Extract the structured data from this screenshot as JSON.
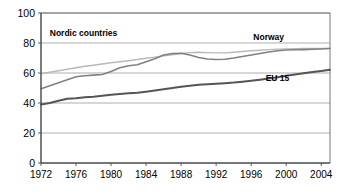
{
  "chart_data": {
    "type": "line",
    "title": "",
    "subtitle": "",
    "xlabel": "",
    "ylabel": "",
    "xlim": [
      1972,
      2005
    ],
    "ylim": [
      0,
      100
    ],
    "yticks": [
      0,
      20,
      40,
      60,
      80,
      100
    ],
    "xticks": [
      1972,
      1976,
      1980,
      1984,
      1988,
      1992,
      1996,
      2000,
      2004
    ],
    "grid": true,
    "legend_position": "inline-annotations",
    "x": [
      1972,
      1973,
      1974,
      1975,
      1976,
      1977,
      1978,
      1979,
      1980,
      1981,
      1982,
      1983,
      1984,
      1985,
      1986,
      1987,
      1988,
      1989,
      1990,
      1991,
      1992,
      1993,
      1994,
      1995,
      1996,
      1997,
      1998,
      1999,
      2000,
      2001,
      2002,
      2003,
      2004,
      2005
    ],
    "series": [
      {
        "name": "Nordic countries",
        "color": "#b9b9b9",
        "label_x": 1973,
        "label_y": 85,
        "values": [
          59.5,
          60.5,
          61.5,
          62.5,
          63.5,
          64.5,
          65.2,
          66.0,
          66.8,
          67.5,
          68.2,
          69.0,
          69.8,
          70.6,
          71.4,
          72.2,
          73.0,
          73.6,
          73.8,
          73.6,
          73.4,
          73.4,
          73.8,
          74.3,
          74.8,
          75.2,
          75.6,
          75.9,
          76.1,
          76.2,
          76.3,
          76.3,
          76.4,
          76.5
        ]
      },
      {
        "name": "Norway",
        "color": "#808080",
        "label_x": 1998,
        "label_y": 82,
        "values": [
          49.5,
          51.5,
          53.5,
          55.5,
          57.5,
          58.2,
          58.6,
          59.0,
          61.0,
          63.5,
          64.8,
          65.5,
          67.5,
          69.5,
          72.0,
          73.0,
          73.2,
          72.0,
          70.3,
          69.3,
          69.0,
          69.2,
          70.0,
          71.0,
          72.0,
          73.0,
          74.0,
          74.8,
          75.3,
          75.5,
          75.6,
          75.8,
          76.0,
          76.3
        ]
      },
      {
        "name": "EU 15",
        "color": "#555555",
        "label_x": 1999,
        "label_y": 55,
        "values": [
          39.0,
          40.0,
          41.5,
          42.8,
          43.2,
          43.8,
          44.2,
          44.8,
          45.5,
          46.0,
          46.5,
          46.8,
          47.5,
          48.3,
          49.2,
          50.0,
          50.8,
          51.5,
          52.2,
          52.5,
          52.8,
          53.2,
          53.6,
          54.2,
          54.8,
          55.5,
          56.3,
          57.2,
          58.2,
          59.0,
          59.8,
          60.6,
          61.4,
          62.2
        ]
      }
    ]
  },
  "axis": {
    "ytick_labels": [
      "0",
      "20",
      "40",
      "60",
      "80",
      "100"
    ],
    "xtick_labels": [
      "1972",
      "1976",
      "1980",
      "1984",
      "1988",
      "1992",
      "1996",
      "2000",
      "2004"
    ]
  },
  "annotations": {
    "nordic_label": "Nordic countries",
    "norway_label": "Norway",
    "eu15_label": "EU 15"
  }
}
